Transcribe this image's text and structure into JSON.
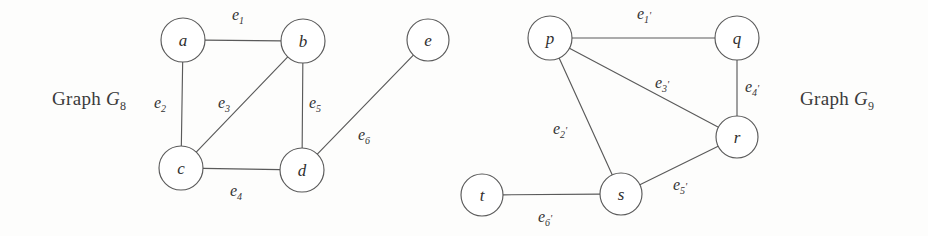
{
  "figure": {
    "background_color": "#fdfdfc",
    "ink_color": "#5a5a5a",
    "text_color": "#333333"
  },
  "captions": {
    "left": {
      "prefix": "Graph ",
      "letter": "G",
      "subscript": "8",
      "full": "Graph G8"
    },
    "right": {
      "prefix": "Graph ",
      "letter": "G",
      "subscript": "9",
      "full": "Graph G9"
    }
  },
  "graphs": [
    {
      "id": "g8",
      "name": "Graph G8",
      "nodes": [
        {
          "id": "a",
          "label": "a",
          "x": 183,
          "y": 40,
          "r": 22
        },
        {
          "id": "b",
          "label": "b",
          "x": 303,
          "y": 41,
          "r": 22
        },
        {
          "id": "c",
          "label": "c",
          "x": 181,
          "y": 168,
          "r": 22
        },
        {
          "id": "d",
          "label": "d",
          "x": 302,
          "y": 170,
          "r": 22
        },
        {
          "id": "e",
          "label": "e",
          "x": 428,
          "y": 40,
          "r": 21
        }
      ],
      "edges": [
        {
          "id": "e1",
          "label": "e",
          "subscript": "1",
          "prime": "",
          "from": "a",
          "to": "b",
          "label_x": 238,
          "label_y": 20
        },
        {
          "id": "e2",
          "label": "e",
          "subscript": "2",
          "prime": "",
          "from": "a",
          "to": "c",
          "label_x": 160,
          "label_y": 108
        },
        {
          "id": "e3",
          "label": "e",
          "subscript": "3",
          "prime": "",
          "from": "c",
          "to": "b",
          "label_x": 224,
          "label_y": 108
        },
        {
          "id": "e4",
          "label": "e",
          "subscript": "4",
          "prime": "",
          "from": "c",
          "to": "d",
          "label_x": 236,
          "label_y": 196
        },
        {
          "id": "e5",
          "label": "e",
          "subscript": "5",
          "prime": "",
          "from": "b",
          "to": "d",
          "label_x": 315,
          "label_y": 108
        },
        {
          "id": "e6",
          "label": "e",
          "subscript": "6",
          "prime": "",
          "from": "d",
          "to": "e",
          "label_x": 364,
          "label_y": 140
        }
      ]
    },
    {
      "id": "g9",
      "name": "Graph G9",
      "nodes": [
        {
          "id": "p",
          "label": "p",
          "x": 550,
          "y": 38,
          "r": 22
        },
        {
          "id": "q",
          "label": "q",
          "x": 737,
          "y": 38,
          "r": 22
        },
        {
          "id": "r",
          "label": "r",
          "x": 737,
          "y": 137,
          "r": 21
        },
        {
          "id": "s",
          "label": "s",
          "x": 621,
          "y": 194,
          "r": 21
        },
        {
          "id": "t",
          "label": "t",
          "x": 482,
          "y": 195,
          "r": 21
        }
      ],
      "edges": [
        {
          "id": "e1p",
          "label": "e",
          "subscript": "1",
          "prime": "'",
          "from": "p",
          "to": "q",
          "label_x": 644,
          "label_y": 19
        },
        {
          "id": "e2p",
          "label": "e",
          "subscript": "2",
          "prime": "'",
          "from": "p",
          "to": "s",
          "label_x": 560,
          "label_y": 134
        },
        {
          "id": "e3p",
          "label": "e",
          "subscript": "3",
          "prime": "'",
          "from": "p",
          "to": "r",
          "label_x": 662,
          "label_y": 88
        },
        {
          "id": "e4p",
          "label": "e",
          "subscript": "4",
          "prime": "'",
          "from": "q",
          "to": "r",
          "label_x": 752,
          "label_y": 92
        },
        {
          "id": "e5p",
          "label": "e",
          "subscript": "5",
          "prime": "'",
          "from": "s",
          "to": "r",
          "label_x": 680,
          "label_y": 190
        },
        {
          "id": "e6p",
          "label": "e",
          "subscript": "6",
          "prime": "'",
          "from": "t",
          "to": "s",
          "label_x": 545,
          "label_y": 222
        }
      ]
    }
  ]
}
